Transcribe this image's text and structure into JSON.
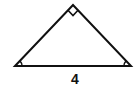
{
  "figure": {
    "type": "right isosceles triangle",
    "base_label": "4",
    "marks": {
      "apex": "right-angle",
      "base_left": "angle-arc",
      "base_right": "angle-arc"
    },
    "colors": {
      "stroke": "#111111",
      "background": "#ffffff"
    }
  }
}
